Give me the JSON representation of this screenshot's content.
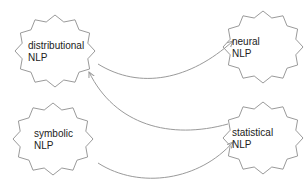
{
  "diagram": {
    "nodes": [
      {
        "id": "distributional",
        "line1": "distributional",
        "line2": "NLP",
        "cx": 55,
        "cy": 51,
        "label_x": 28,
        "label_y": 40
      },
      {
        "id": "neural",
        "line1": "neural",
        "line2": "NLP",
        "cx": 263,
        "cy": 47,
        "label_x": 232,
        "label_y": 36
      },
      {
        "id": "symbolic",
        "line1": "symbolic",
        "line2": "NLP",
        "cx": 53,
        "cy": 139,
        "label_x": 34,
        "label_y": 128
      },
      {
        "id": "statistical",
        "line1": "statistical",
        "line2": "NLP",
        "cx": 263,
        "cy": 138,
        "label_x": 232,
        "label_y": 127
      }
    ],
    "edges": [
      {
        "from": "distributional",
        "to": "neural"
      },
      {
        "from": "statistical",
        "to": "distributional"
      },
      {
        "from": "symbolic",
        "to": "statistical"
      }
    ],
    "colors": {
      "stroke": "#9a9a9a",
      "text": "#222222",
      "background": "#ffffff"
    }
  }
}
